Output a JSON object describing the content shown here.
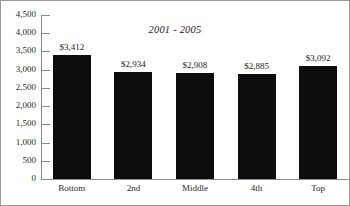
{
  "chart_data": {
    "type": "bar",
    "title": "2001 - 2005",
    "xlabel": "",
    "ylabel": "",
    "categories": [
      "Bottom",
      "2nd",
      "Middle",
      "4th",
      "Top"
    ],
    "values": [
      3412,
      2934,
      2908,
      2885,
      3092
    ],
    "value_labels": [
      "$3,412",
      "$2,934",
      "$2,908",
      "$2,885",
      "$3,092"
    ],
    "ylim": [
      0,
      4500
    ],
    "ytick_values": [
      0,
      500,
      1000,
      1500,
      2000,
      2500,
      3000,
      3500,
      4000,
      4500
    ],
    "ytick_labels": [
      "0",
      "500",
      "1,000",
      "1,500",
      "2,000",
      "2,500",
      "3,000",
      "3,500",
      "4,000",
      "4,500"
    ],
    "grid": false,
    "legend": null,
    "series": [
      {
        "name": "",
        "values": [
          3412,
          2934,
          2908,
          2885,
          3092
        ],
        "color": "#0d0d0d"
      }
    ],
    "colors": {
      "bar": "#0d0d0d",
      "axis": "#8c8c8c",
      "text": "#1a1a1a",
      "frame": "#9a9a9a",
      "background": "#ffffff"
    }
  }
}
